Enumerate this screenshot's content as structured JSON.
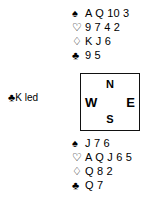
{
  "diagram": {
    "type": "bridge-deal-diagram",
    "north_hand": {
      "label": "North",
      "suits": [
        {
          "suit": "spades",
          "symbol": "♠",
          "filled": true,
          "cards": "A Q 10 3"
        },
        {
          "suit": "hearts",
          "symbol": "♡",
          "filled": false,
          "cards": "9 7 4 2"
        },
        {
          "suit": "diamonds",
          "symbol": "♢",
          "filled": false,
          "cards": "K J 6"
        },
        {
          "suit": "clubs",
          "symbol": "♣",
          "filled": true,
          "cards": "9 5"
        }
      ]
    },
    "south_hand": {
      "label": "South",
      "suits": [
        {
          "suit": "spades",
          "symbol": "♠",
          "filled": true,
          "cards": "J 7 6"
        },
        {
          "suit": "hearts",
          "symbol": "♡",
          "filled": false,
          "cards": "A Q J 6 5"
        },
        {
          "suit": "diamonds",
          "symbol": "♢",
          "filled": false,
          "cards": "Q 8 2"
        },
        {
          "suit": "clubs",
          "symbol": "♣",
          "filled": true,
          "cards": "Q 7"
        }
      ]
    },
    "compass": {
      "north": "N",
      "west": "W",
      "east": "E",
      "south": "S"
    },
    "opening_lead": {
      "suit_symbol": "♣",
      "card": "K",
      "text": "led"
    },
    "colors": {
      "ink": "#000000",
      "background": "#ffffff",
      "box_border": "#111111"
    }
  }
}
